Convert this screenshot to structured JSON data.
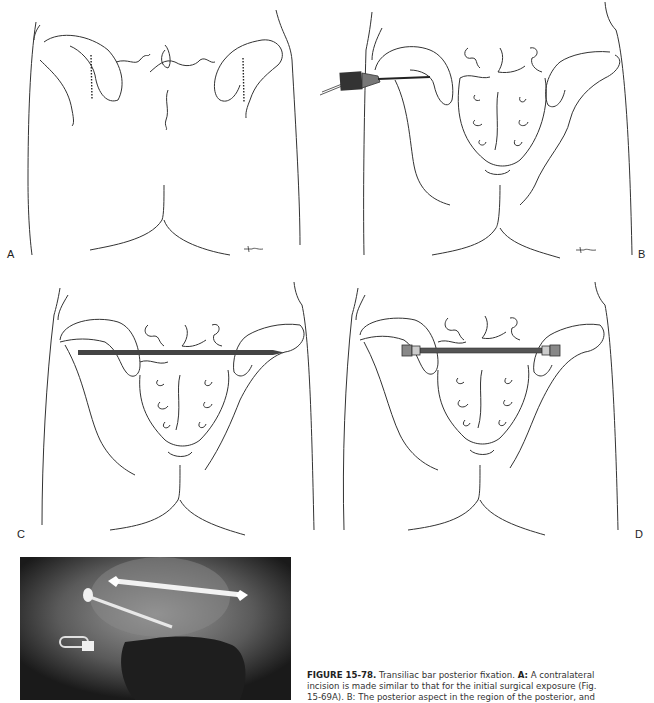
{
  "figure": {
    "number": "FIGURE 15-78.",
    "title": "Transiliac bar posterior fixation.",
    "caption_lines": [
      {
        "label": "A:",
        "text": "A contralateral"
      },
      {
        "text": "incision is made similar to that for the initial surgical exposure (Fig."
      },
      {
        "text": "15-69A). B: The posterior aspect in the region of the posterior, and"
      }
    ]
  },
  "panels": [
    {
      "id": "A",
      "label": "A",
      "description": "Posterior view of pelvis outline with dotted incision lines over both posterior iliac crests"
    },
    {
      "id": "B",
      "label": "B",
      "description": "Drill passing through the posterior iliac crest toward the sacrum"
    },
    {
      "id": "C",
      "label": "C",
      "description": "Threaded transiliac bar passed across both iliac wings"
    },
    {
      "id": "D",
      "label": "D",
      "description": "Transiliac bar secured with nuts and washers on both sides"
    },
    {
      "id": "E",
      "label": "",
      "description": "Radiograph showing transiliac bar and iliosacral screw fixation"
    }
  ],
  "colors": {
    "line": "#333333",
    "bar": "#555555",
    "xray_bg": "#141414"
  }
}
